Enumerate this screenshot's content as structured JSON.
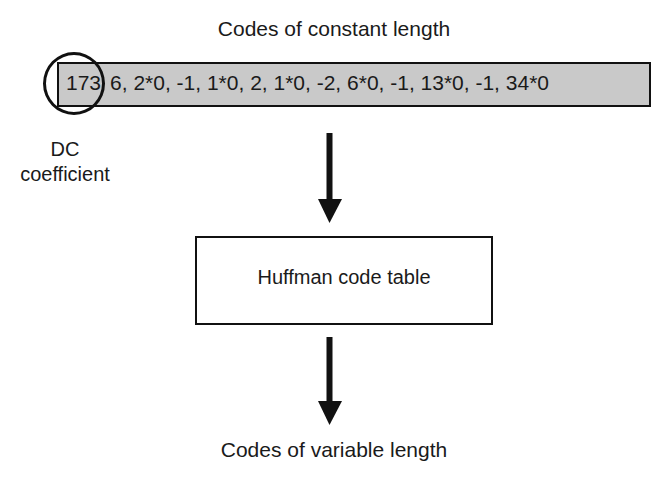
{
  "diagram": {
    "top_label": "Codes of constant length",
    "sequence": {
      "dc_value": "173",
      "ac_values": "6, 2*0, -1, 1*0, 2, 1*0, -2, 6*0, -1, 13*0, -1, 34*0",
      "items": [
        "173",
        "6",
        "2*0",
        "-1",
        "1*0",
        "2",
        "1*0",
        "-2",
        "6*0",
        "-1",
        "13*0",
        "-1",
        "34*0"
      ]
    },
    "dc_annotation": {
      "line1": "DC",
      "line2": "coefficient"
    },
    "process_box": "Huffman code table",
    "bottom_label": "Codes of variable length",
    "colors": {
      "sequence_fill": "#c9c9c9",
      "stroke": "#111111",
      "text": "#1a1a1a",
      "background": "#ffffff"
    }
  }
}
